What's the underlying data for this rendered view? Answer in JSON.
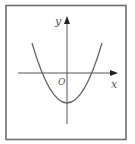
{
  "figure": {
    "frame_color": "#6e6e6e",
    "axis_color": "#555555",
    "curve_color": "#666666",
    "labels": {
      "y_axis": "y",
      "x_axis": "x",
      "origin": "O"
    },
    "curve": {
      "type": "parabola",
      "opens": "up",
      "vertex_position": "below x-axis, on y-axis",
      "x_intercepts": "one negative, one positive"
    }
  }
}
